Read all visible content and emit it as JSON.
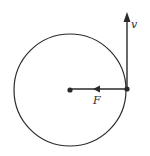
{
  "diagram": {
    "type": "circular-motion-vectors",
    "colors": {
      "stroke": "#2a2a2a",
      "background": "#ffffff"
    },
    "circle": {
      "cx": 70,
      "cy": 90,
      "r": 56
    },
    "center_point": {
      "x": 70,
      "y": 90
    },
    "object_point": {
      "x": 127,
      "y": 89
    },
    "vectors": [
      {
        "id": "velocity",
        "label": "v",
        "direction": "up",
        "from": {
          "x": 127,
          "y": 89
        },
        "to": {
          "x": 127,
          "y": 13
        }
      },
      {
        "id": "force",
        "label": "F",
        "direction": "toward-center",
        "from": {
          "x": 127,
          "y": 89
        },
        "to": {
          "x": 70,
          "y": 89
        },
        "arrowhead_at": {
          "x": 96,
          "y": 89
        }
      }
    ],
    "labels": {
      "velocity": "v",
      "force": "F"
    }
  }
}
